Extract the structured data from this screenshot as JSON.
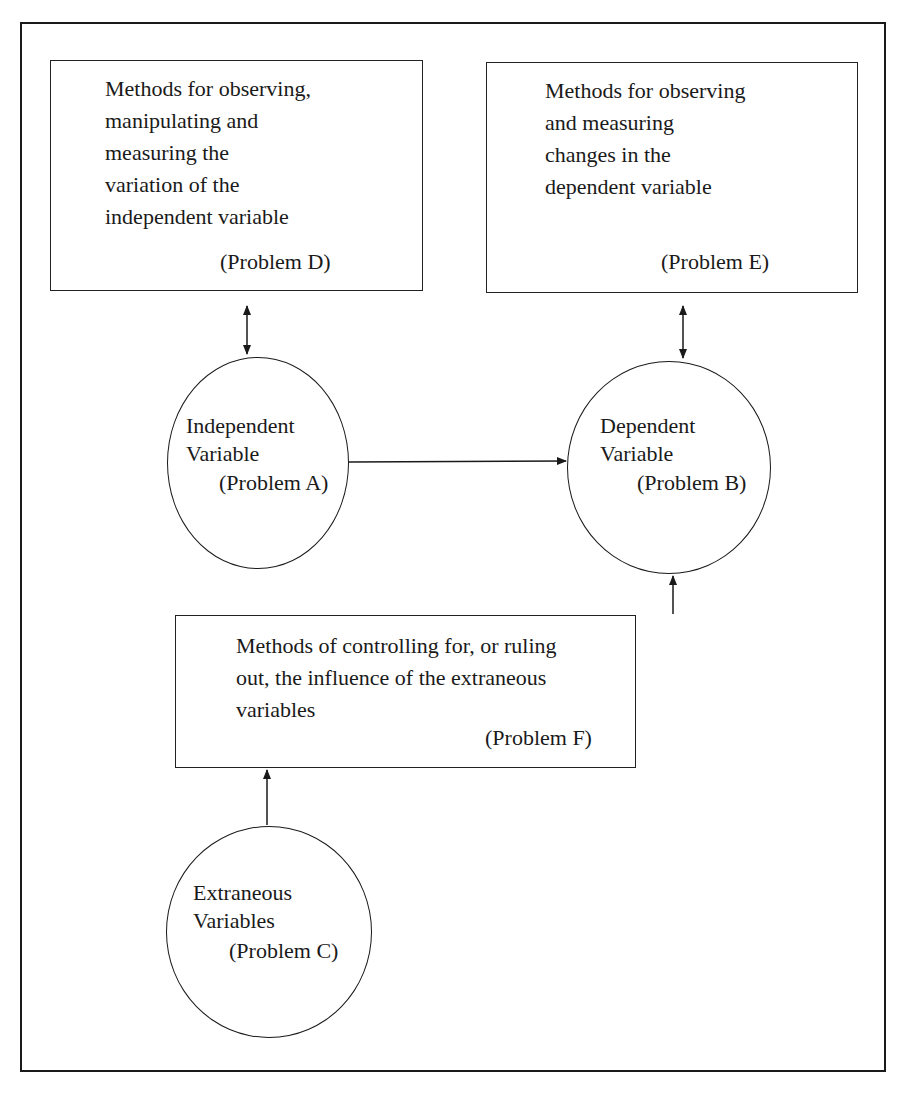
{
  "diagram": {
    "boxes": {
      "problem_d": {
        "text": "Methods for observing,\nmanipulating and\nmeasuring the\nvariation of the\nindependent variable",
        "label": "(Problem D)"
      },
      "problem_e": {
        "text": "Methods for observing\nand measuring\nchanges in the\ndependent variable",
        "label": "(Problem E)"
      },
      "problem_f": {
        "text": "Methods of controlling for, or ruling\nout, the influence of the extraneous\nvariables",
        "label": "(Problem F)"
      }
    },
    "circles": {
      "problem_a": {
        "line1": "Independent",
        "line2": "Variable",
        "label": "(Problem A)"
      },
      "problem_b": {
        "line1": "Dependent",
        "line2": "Variable",
        "label": "(Problem B)"
      },
      "problem_c": {
        "line1": "Extraneous",
        "line2": "Variables",
        "label": "(Problem C)"
      }
    },
    "connections": [
      {
        "from": "problem_d",
        "to": "problem_a",
        "type": "bidirectional"
      },
      {
        "from": "problem_e",
        "to": "problem_b",
        "type": "bidirectional"
      },
      {
        "from": "problem_a",
        "to": "problem_b",
        "type": "directed"
      },
      {
        "from": "problem_f",
        "to": "problem_b",
        "type": "directed"
      },
      {
        "from": "problem_c",
        "to": "problem_f",
        "type": "directed"
      }
    ],
    "colors": {
      "line": "#1a1a1a",
      "background": "#ffffff"
    }
  }
}
